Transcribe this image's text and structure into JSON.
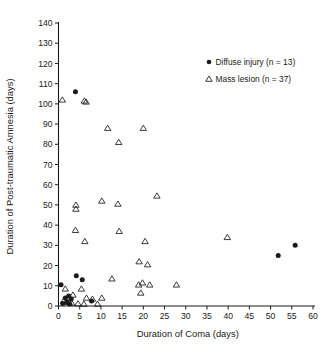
{
  "chart_data": {
    "type": "scatter",
    "title": "",
    "xlabel": "Duration of Coma (days)",
    "ylabel": "Duration of Post-traumatic Amnesia (days)",
    "xlim": [
      0,
      60
    ],
    "ylim": [
      0,
      140
    ],
    "xticks": [
      0,
      5,
      10,
      15,
      20,
      25,
      30,
      35,
      40,
      45,
      50,
      55,
      60
    ],
    "yticks": [
      0,
      10,
      20,
      30,
      40,
      50,
      60,
      70,
      80,
      90,
      100,
      110,
      120,
      130,
      140
    ],
    "grid": false,
    "legend_position": "upper-right",
    "series": [
      {
        "name": "Diffuse injury (n = 13)",
        "marker": "filled-circle",
        "color": "#1a1a1a",
        "n": 13,
        "points": [
          [
            0.6,
            10.5
          ],
          [
            1.0,
            1.2
          ],
          [
            1.6,
            4.0
          ],
          [
            2.0,
            2.0
          ],
          [
            2.4,
            5.0
          ],
          [
            2.6,
            1.0
          ],
          [
            3.0,
            3.5
          ],
          [
            4.0,
            106.0
          ],
          [
            4.2,
            15.0
          ],
          [
            5.6,
            13.0
          ],
          [
            7.8,
            2.5
          ],
          [
            51.8,
            25.0
          ],
          [
            55.8,
            30.0
          ]
        ]
      },
      {
        "name": "Mass lesion (n = 37)",
        "marker": "open-triangle",
        "color": "#1a1a1a",
        "n": 37,
        "points": [
          [
            0.9,
            102.0
          ],
          [
            6.1,
            101.5
          ],
          [
            6.5,
            101.0
          ],
          [
            11.6,
            88.0
          ],
          [
            20.0,
            88.0
          ],
          [
            14.2,
            81.0
          ],
          [
            23.2,
            54.5
          ],
          [
            10.2,
            52.0
          ],
          [
            14.0,
            50.5
          ],
          [
            4.1,
            50.0
          ],
          [
            4.1,
            48.0
          ],
          [
            4.0,
            37.5
          ],
          [
            14.3,
            37.0
          ],
          [
            39.8,
            34.0
          ],
          [
            6.2,
            32.0
          ],
          [
            20.4,
            32.0
          ],
          [
            19.0,
            22.0
          ],
          [
            21.0,
            20.5
          ],
          [
            12.6,
            13.5
          ],
          [
            19.8,
            11.5
          ],
          [
            18.9,
            10.5
          ],
          [
            21.5,
            10.5
          ],
          [
            27.8,
            10.5
          ],
          [
            1.6,
            8.5
          ],
          [
            5.4,
            8.5
          ],
          [
            19.4,
            6.5
          ],
          [
            3.4,
            5.5
          ],
          [
            6.6,
            4.0
          ],
          [
            8.0,
            3.5
          ],
          [
            10.2,
            4.0
          ],
          [
            1.2,
            2.5
          ],
          [
            1.9,
            2.0
          ],
          [
            2.5,
            1.8
          ],
          [
            3.1,
            1.5
          ],
          [
            4.6,
            1.2
          ],
          [
            6.0,
            1.0
          ],
          [
            9.2,
            1.0
          ]
        ]
      }
    ]
  },
  "legend": {
    "entries": [
      {
        "label": "Diffuse injury (n = 13)",
        "marker": "filled-circle"
      },
      {
        "label": "Mass lesion (n = 37)",
        "marker": "open-triangle"
      }
    ]
  },
  "axes": {
    "x_title": "Duration of Coma (days)",
    "y_title": "Duration of Post-traumatic Amnesia (days)",
    "x_tick_labels": [
      "0",
      "5",
      "10",
      "15",
      "20",
      "25",
      "30",
      "35",
      "40",
      "45",
      "50",
      "55",
      "60"
    ],
    "y_tick_labels": [
      "0",
      "10",
      "20",
      "30",
      "40",
      "50",
      "60",
      "70",
      "80",
      "90",
      "100",
      "110",
      "120",
      "130",
      "140"
    ]
  },
  "colors": {
    "ink": "#1a1a1a",
    "background": "#ffffff"
  }
}
